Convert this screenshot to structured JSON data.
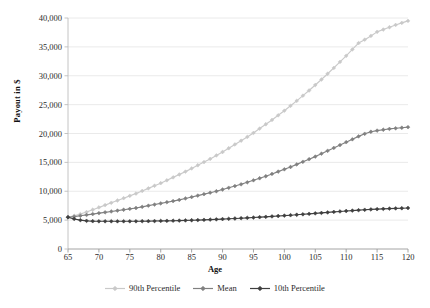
{
  "chart_data": {
    "type": "line",
    "title": "",
    "xlabel": "Age",
    "ylabel": "Payout in $",
    "xlim": [
      65,
      120
    ],
    "ylim": [
      0,
      40000
    ],
    "grid": "horizontal",
    "legend_position": "bottom-center",
    "xticks": [
      65,
      70,
      75,
      80,
      85,
      90,
      95,
      100,
      105,
      110,
      115,
      120
    ],
    "xtick_labels": [
      "65",
      "70",
      "75",
      "80",
      "85",
      "90",
      "95",
      "100",
      "105",
      "110",
      "115",
      "120"
    ],
    "yticks": [
      0,
      5000,
      10000,
      15000,
      20000,
      25000,
      30000,
      35000,
      40000
    ],
    "ytick_labels": [
      "0",
      "5,000",
      "10,000",
      "15,000",
      "20,000",
      "25,000",
      "30,000",
      "35,000",
      "40,000"
    ],
    "x": [
      65,
      66,
      67,
      68,
      69,
      70,
      71,
      72,
      73,
      74,
      75,
      76,
      77,
      78,
      79,
      80,
      81,
      82,
      83,
      84,
      85,
      86,
      87,
      88,
      89,
      90,
      91,
      92,
      93,
      94,
      95,
      96,
      97,
      98,
      99,
      100,
      101,
      102,
      103,
      104,
      105,
      106,
      107,
      108,
      109,
      110,
      111,
      112,
      113,
      114,
      115,
      116,
      117,
      118,
      119,
      120
    ],
    "series": [
      {
        "name": "90th Percentile",
        "color": "#c9c9c9",
        "marker": "diamond",
        "values": [
          5500,
          5750,
          6050,
          6400,
          6800,
          7200,
          7600,
          8000,
          8400,
          8800,
          9200,
          9600,
          10050,
          10500,
          10950,
          11400,
          11900,
          12400,
          12900,
          13400,
          13950,
          14500,
          15050,
          15600,
          16200,
          16800,
          17450,
          18100,
          18750,
          19400,
          20100,
          20850,
          21600,
          22350,
          23150,
          23950,
          24800,
          25650,
          26550,
          27450,
          28400,
          29350,
          30350,
          31350,
          32400,
          33450,
          34550,
          35650,
          36250,
          36900,
          37600,
          38000,
          38400,
          38800,
          39150,
          39500
        ]
      },
      {
        "name": "Mean",
        "color": "#808080",
        "marker": "diamond",
        "values": [
          5500,
          5600,
          5750,
          5900,
          6050,
          6200,
          6350,
          6500,
          6650,
          6800,
          6950,
          7100,
          7300,
          7500,
          7700,
          7900,
          8100,
          8300,
          8500,
          8750,
          9000,
          9250,
          9500,
          9750,
          10000,
          10300,
          10600,
          10900,
          11200,
          11550,
          11900,
          12250,
          12600,
          13000,
          13400,
          13800,
          14200,
          14650,
          15100,
          15550,
          16000,
          16500,
          17000,
          17500,
          18000,
          18500,
          19000,
          19500,
          19950,
          20300,
          20500,
          20650,
          20800,
          20900,
          21000,
          21100
        ]
      },
      {
        "name": "10th Percentile",
        "color": "#3f3f3f",
        "marker": "diamond",
        "values": [
          5500,
          5200,
          5000,
          4880,
          4820,
          4800,
          4800,
          4800,
          4800,
          4800,
          4800,
          4800,
          4810,
          4820,
          4840,
          4860,
          4880,
          4900,
          4920,
          4950,
          4980,
          5010,
          5050,
          5090,
          5130,
          5180,
          5230,
          5280,
          5330,
          5390,
          5450,
          5510,
          5570,
          5640,
          5710,
          5780,
          5850,
          5930,
          6010,
          6090,
          6170,
          6250,
          6330,
          6420,
          6500,
          6580,
          6650,
          6720,
          6790,
          6850,
          6900,
          6950,
          7000,
          7030,
          7060,
          7100
        ]
      }
    ]
  },
  "legend": {
    "items": [
      {
        "label": "90th Percentile"
      },
      {
        "label": "Mean"
      },
      {
        "label": "10th Percentile"
      }
    ]
  }
}
